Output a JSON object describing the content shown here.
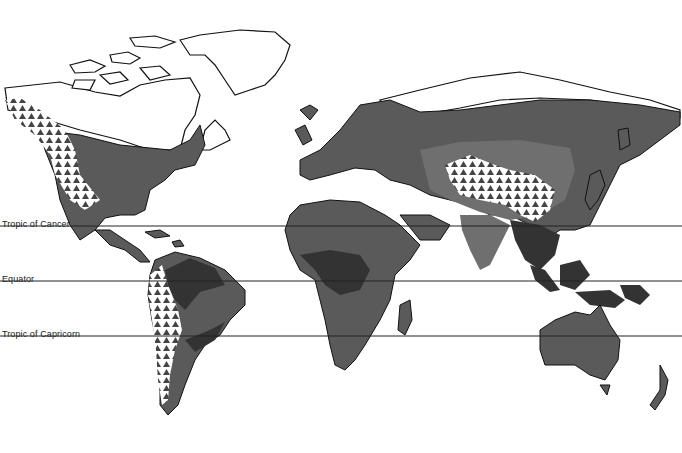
{
  "map": {
    "type": "world vegetation/climate zone map",
    "colors": {
      "background": "#ffffff",
      "outline": "#111111",
      "zone_dark": "#333333",
      "zone_mid": "#5a5a5a",
      "zone_light": "#6f6f6f",
      "mountain_pattern": "#ffffff with dark triangles"
    },
    "reference_lines": [
      {
        "id": "tropic-of-cancer",
        "label": "Tropic of Cancer",
        "y": 226
      },
      {
        "id": "equator",
        "label": "Equator",
        "label_visible": "Equator",
        "y": 281
      },
      {
        "id": "tropic-of-capricorn",
        "label": "Tropic of Capricorn",
        "y": 336
      }
    ]
  }
}
